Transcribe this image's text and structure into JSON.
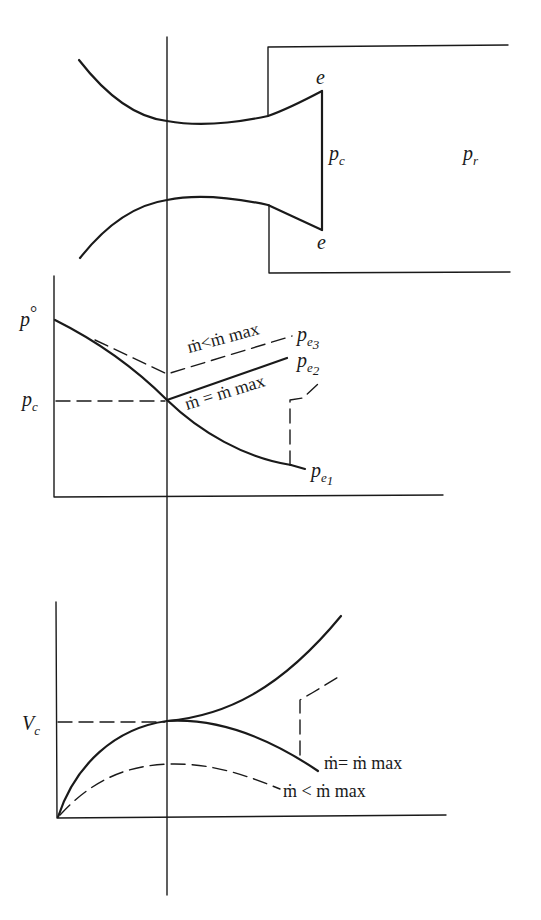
{
  "diagram": {
    "nozzle": {
      "exit_label": "e",
      "exit_pressure_label": "p",
      "exit_pressure_sub": "c",
      "receiver_pressure_label": "p",
      "receiver_pressure_sub": "r"
    },
    "pressure_plot": {
      "y_label_top": "p°",
      "y_label_top_main": "p",
      "y_label_top_sup": "°",
      "y_label_critical_main": "p",
      "y_label_critical_sub": "c",
      "curve_labels": [
        {
          "main": "p",
          "sub": "e",
          "subsub": "3"
        },
        {
          "main": "p",
          "sub": "e",
          "subsub": "2"
        },
        {
          "main": "p",
          "sub": "e",
          "subsub": "1"
        }
      ],
      "annotation_less": "ṁ<ṁ max",
      "annotation_equal": "ṁ = ṁ max"
    },
    "velocity_plot": {
      "y_label_critical_main": "V",
      "y_label_critical_sub": "c",
      "annotation_equal": "ṁ= ṁ  max",
      "annotation_less": "ṁ < ṁ max"
    }
  }
}
